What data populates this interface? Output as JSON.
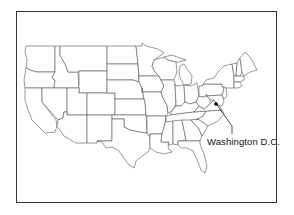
{
  "map": {
    "title": "",
    "region": "United States (contiguous)",
    "annotation": {
      "label": "Washington D.C.",
      "marker_color": "#000000"
    },
    "colors": {
      "frame": "#333333",
      "state_stroke": "#555555",
      "state_fill": "#ffffff",
      "background": "#ffffff"
    }
  }
}
